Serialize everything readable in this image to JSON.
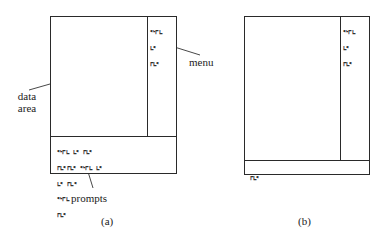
{
  "figure": {
    "panel_a": {
      "caption": "(a)",
      "menu_items": [
        "ᑦᒻᒥᒪ",
        "ᒪᑦ",
        "ᒥᒪᑦ"
      ],
      "prompt_lines": [
        "ᑦᒻᒥᒪ ᒪᑦ ᒥᒪᑦ",
        "ᒥᒪᑦᒥᒪᑦ ᑦᒻᒥᒪ ᒪᑦ",
        "ᒪᑦ ᒥᒪᑦ",
        "ᑦᒻᒥᒪ",
        "ᒥᒪᑦ"
      ],
      "labels": {
        "data_area_line1": "data",
        "data_area_line2": "area",
        "menu": "menu",
        "prompts": "prompts"
      }
    },
    "panel_b": {
      "caption": "(b)",
      "menu_items": [
        "ᑦᒻᒥᒪ",
        "ᒪᑦ",
        "ᒥᒪᑦ"
      ],
      "prompt_lines": [
        "ᒥᒪᑦ"
      ]
    },
    "line_color": "#2a2a2a"
  }
}
